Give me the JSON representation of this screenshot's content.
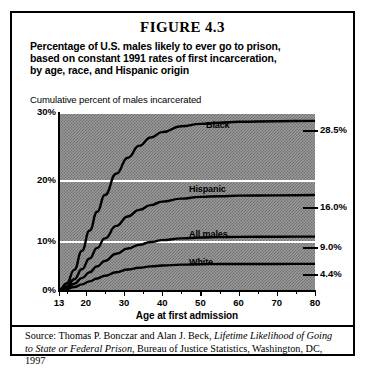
{
  "figure": {
    "number": "FIGURE 4.3",
    "title_lines": [
      "Percentage of U.S. males likely to ever go to prison,",
      "based on constant 1991 rates of first incarceration,",
      "by age, race, and Hispanic origin"
    ],
    "source_prefix": "Source: Thomas P. Bonczar and Alan J. Beck, ",
    "source_italic_1": "Lifetime Likelihood of Going to",
    "source_italic_2": "State or Federal Prison",
    "source_suffix": ", Bureau of Justice Statistics, Washington, DC, 1997"
  },
  "chart_data": {
    "type": "line",
    "title": "Percentage of U.S. males likely to ever go to prison, based on constant 1991 rates of first incarceration, by age, race, and Hispanic origin",
    "xlabel": "Age at first admission",
    "ylabel": "Cumulative percent of males incarcerated",
    "xlim": [
      13,
      80
    ],
    "ylim": [
      0,
      30
    ],
    "xticks": [
      13,
      20,
      30,
      40,
      50,
      60,
      70,
      80
    ],
    "xtick_labels": [
      "13",
      "20",
      "30",
      "40",
      "50",
      "60",
      "70",
      "80"
    ],
    "xminor_ticks": [
      15,
      25,
      35,
      45,
      55,
      65,
      75
    ],
    "yticks": [
      0,
      10,
      20,
      30
    ],
    "ytick_labels": [
      "0%",
      "10%",
      "20%",
      "30%"
    ],
    "grid": "horizontal white gridlines at 10%, 20%, 30%",
    "legend": "inline series labels above each curve",
    "plot_background": "#9a9a9a dithered gray",
    "line_color": "#000000",
    "series": [
      {
        "name": "Black",
        "end_label": "28.5%",
        "end_value": 28.5,
        "x": [
          13,
          15,
          17,
          19,
          21,
          23,
          25,
          28,
          31,
          34,
          37,
          40,
          45,
          50,
          55,
          60,
          70,
          80
        ],
        "values": [
          0,
          1.1,
          3.4,
          6.6,
          10.0,
          13.2,
          16.0,
          19.6,
          22.3,
          24.3,
          25.7,
          26.6,
          27.6,
          28.0,
          28.2,
          28.35,
          28.45,
          28.5
        ]
      },
      {
        "name": "Hispanic",
        "end_label": "16.0%",
        "end_value": 16.0,
        "x": [
          13,
          15,
          17,
          19,
          21,
          23,
          25,
          28,
          31,
          34,
          37,
          40,
          45,
          50,
          55,
          60,
          70,
          80
        ],
        "values": [
          0,
          0.6,
          1.8,
          3.5,
          5.3,
          7.1,
          8.7,
          10.8,
          12.4,
          13.5,
          14.3,
          14.9,
          15.4,
          15.7,
          15.8,
          15.9,
          15.95,
          16.0
        ]
      },
      {
        "name": "All males",
        "end_label": "9.0%",
        "end_value": 9.0,
        "x": [
          13,
          15,
          17,
          19,
          21,
          23,
          25,
          28,
          31,
          34,
          37,
          40,
          45,
          50,
          55,
          60,
          70,
          80
        ],
        "values": [
          0,
          0.35,
          1.05,
          2.0,
          3.0,
          4.0,
          4.9,
          6.1,
          7.0,
          7.6,
          8.1,
          8.4,
          8.7,
          8.85,
          8.92,
          8.95,
          8.98,
          9.0
        ]
      },
      {
        "name": "White",
        "end_label": "4.4%",
        "end_value": 4.4,
        "x": [
          13,
          15,
          17,
          19,
          21,
          23,
          25,
          28,
          31,
          34,
          37,
          40,
          45,
          50,
          55,
          60,
          70,
          80
        ],
        "values": [
          0,
          0.16,
          0.5,
          0.95,
          1.45,
          1.95,
          2.4,
          3.0,
          3.45,
          3.75,
          3.98,
          4.12,
          4.28,
          4.34,
          4.37,
          4.38,
          4.39,
          4.4
        ]
      }
    ]
  }
}
